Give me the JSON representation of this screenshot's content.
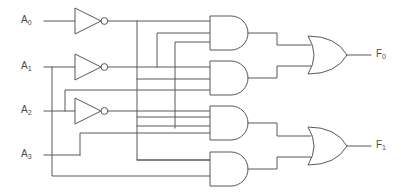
{
  "diagram": {
    "background_color": "#ffffff",
    "line_color": "#58585c",
    "text_color": "#4a4a4e"
  },
  "inputs": [
    {
      "id": "A0",
      "base": "A",
      "index": "0",
      "y": 21
    },
    {
      "id": "A1",
      "base": "A",
      "index": "1",
      "y": 67
    },
    {
      "id": "A2",
      "base": "A",
      "index": "2",
      "y": 111
    },
    {
      "id": "A3",
      "base": "A",
      "index": "3",
      "y": 155
    }
  ],
  "outputs": [
    {
      "id": "F0",
      "base": "F",
      "index": "0",
      "y": 55
    },
    {
      "id": "F1",
      "base": "F",
      "index": "1",
      "y": 146
    }
  ],
  "gates": {
    "inverters": [
      {
        "name": "inverter-a0",
        "input": "A0",
        "output": "A0-not",
        "y": 21
      },
      {
        "name": "inverter-a1",
        "input": "A1",
        "output": "A1-not",
        "y": 67
      },
      {
        "name": "inverter-a2",
        "input": "A2",
        "output": "A2-not",
        "y": 111
      }
    ],
    "and_gates": [
      {
        "name": "and-gate-1",
        "input_count": 3,
        "inputs": [
          "A0-not",
          "A1-not",
          "A2-not"
        ],
        "y": 35
      },
      {
        "name": "and-gate-2",
        "input_count": 3,
        "inputs": [
          "A1-not",
          "A2",
          "A0-not"
        ],
        "y": 79
      },
      {
        "name": "and-gate-3",
        "input_count": 3,
        "inputs": [
          "A2-not",
          "A1-not",
          "A3"
        ],
        "y": 123
      },
      {
        "name": "and-gate-4",
        "input_count": 2,
        "inputs": [
          "A3",
          "A1"
        ],
        "y": 167
      }
    ],
    "or_gates": [
      {
        "name": "or-gate-f0",
        "input_count": 2,
        "output": "F0",
        "y": 55
      },
      {
        "name": "or-gate-f1",
        "input_count": 2,
        "output": "F1",
        "y": 146
      }
    ]
  },
  "legend": {
    "inverter_symbol": "not-gate",
    "and_symbol": "and-gate",
    "or_symbol": "or-gate"
  }
}
